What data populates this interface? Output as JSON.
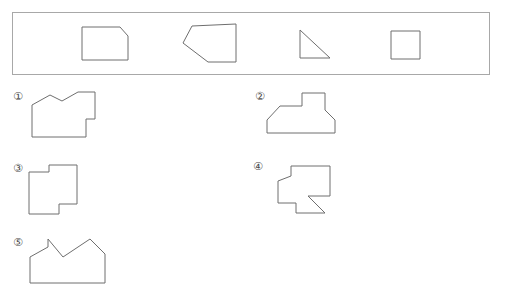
{
  "page": {
    "background_color": "#ffffff",
    "stroke_color": "#6e6e6e",
    "box_border_color": "#a8a8a8"
  },
  "prompt_box": {
    "label": "pieces-panel",
    "x": 12,
    "y": 12,
    "width": 478,
    "height": 63,
    "pieces": [
      {
        "name": "chamfered-square",
        "description": "square with top-right corner cut off",
        "points": "82,27 120,27 128,36 128,60 82,60"
      },
      {
        "name": "left-pointing-pentagon",
        "description": "pentagon with vertical right edge pointing left",
        "points": "236,24 236,62 208,62 183,43 192,26"
      },
      {
        "name": "right-triangle",
        "description": "right triangle with right angle at bottom left",
        "points": "300,30 300,58 330,58"
      },
      {
        "name": "square",
        "description": "plain square",
        "points": "391,31 420,31 420,59 391,59"
      }
    ]
  },
  "options": [
    {
      "id": "option-1",
      "label": "①",
      "label_x": 10,
      "label_y": 90,
      "shape_name": "option-1-shape",
      "points": "32,105 50,95 62,101 78,92 95,92 95,119 86,119 86,137 32,137"
    },
    {
      "id": "option-2",
      "label": "②",
      "label_x": 252,
      "label_y": 90,
      "shape_name": "option-2-shape",
      "points": "302,106 302,93 325,93 325,110 335,120 335,133 267,133 267,120 280,106"
    },
    {
      "id": "option-3",
      "label": "③",
      "label_x": 10,
      "label_y": 162,
      "shape_name": "option-3-shape",
      "points": "49,172 49,165 77,165 77,204 59,204 59,214 29,214 29,172"
    },
    {
      "id": "option-4",
      "label": "④",
      "label_x": 250,
      "label_y": 160,
      "shape_name": "option-4-shape",
      "points": "291,176 291,166 330,166 330,196 308,196 325,213 296,213 296,203 278,203 278,181"
    },
    {
      "id": "option-5",
      "label": "⑤",
      "label_x": 10,
      "label_y": 236,
      "shape_name": "option-5-shape",
      "points": "30,257 48,247 48,239 63,257 90,239 105,254 105,283 30,283"
    }
  ]
}
